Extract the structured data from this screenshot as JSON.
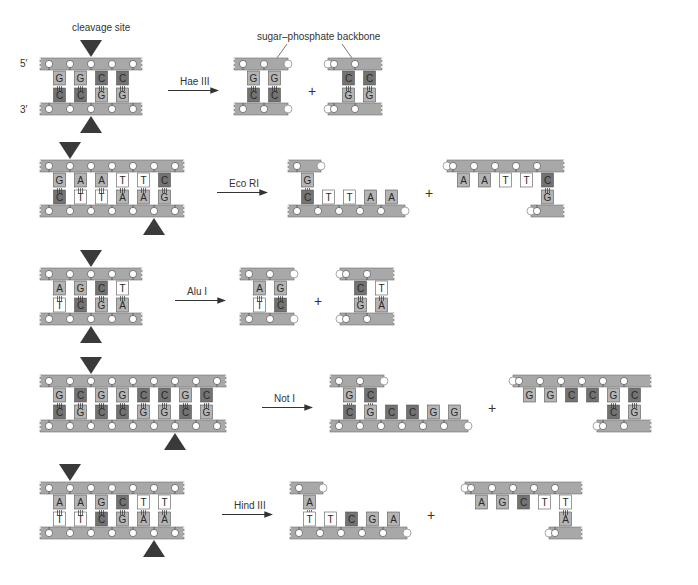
{
  "labels": {
    "cleavage_site": "cleavage site",
    "backbone": "sugar–phosphate backbone",
    "five_prime": "5′",
    "three_prime": "3′",
    "plus": "+"
  },
  "colors": {
    "backbone": "#a8a8a8",
    "backbone_stroke": "#6e6e6e",
    "phosphate": "#ffffff",
    "base_G": "#b4b4b4",
    "base_A": "#b4b4b4",
    "base_C": "#737373",
    "base_T": "#ffffff",
    "cleavage_marker": "#3a3a3a",
    "arrow": "#333333"
  },
  "enzymes": [
    {
      "name": "Hae III",
      "top_seq": [
        "G",
        "G",
        "C",
        "C"
      ],
      "bottom_seq": [
        "C",
        "C",
        "G",
        "G"
      ],
      "top_cut_after": 2,
      "bottom_cut_after": 2,
      "ends": "blunt"
    },
    {
      "name": "Eco RI",
      "top_seq": [
        "G",
        "A",
        "A",
        "T",
        "T",
        "C"
      ],
      "bottom_seq": [
        "C",
        "T",
        "T",
        "A",
        "A",
        "G"
      ],
      "top_cut_after": 1,
      "bottom_cut_after": 5,
      "ends": "5' overhang",
      "fragment_left_overhang": [
        "T",
        "T",
        "A",
        "A"
      ],
      "fragment_right_overhang": [
        "A",
        "A",
        "T",
        "T"
      ]
    },
    {
      "name": "Alu I",
      "top_seq": [
        "A",
        "G",
        "C",
        "T"
      ],
      "bottom_seq": [
        "T",
        "C",
        "G",
        "A"
      ],
      "top_cut_after": 2,
      "bottom_cut_after": 2,
      "ends": "blunt"
    },
    {
      "name": "Not I",
      "top_seq": [
        "G",
        "C",
        "G",
        "G",
        "C",
        "C",
        "G",
        "C"
      ],
      "bottom_seq": [
        "C",
        "G",
        "C",
        "C",
        "G",
        "G",
        "C",
        "G"
      ],
      "top_cut_after": 2,
      "bottom_cut_after": 6,
      "ends": "5' overhang",
      "fragment_left_overhang": [
        "C",
        "C",
        "G",
        "G"
      ],
      "fragment_right_overhang": [
        "G",
        "G",
        "C",
        "C"
      ]
    },
    {
      "name": "Hind III",
      "top_seq": [
        "A",
        "A",
        "G",
        "C",
        "T",
        "T"
      ],
      "bottom_seq": [
        "T",
        "T",
        "C",
        "G",
        "A",
        "A"
      ],
      "top_cut_after": 1,
      "bottom_cut_after": 5,
      "ends": "5' overhang",
      "fragment_left_overhang": [
        "T",
        "C",
        "G",
        "A"
      ],
      "fragment_right_overhang": [
        "A",
        "G",
        "C",
        "T"
      ]
    }
  ]
}
